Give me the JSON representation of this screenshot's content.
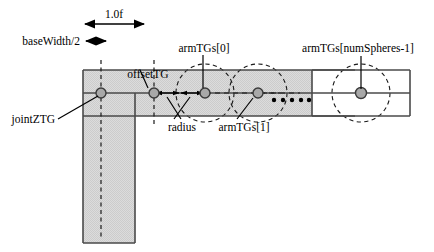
{
  "figure": {
    "kind": "technical-diagram",
    "background_color": "#ffffff",
    "line_color": "#000000",
    "fill_gray": "#d9d9d9",
    "sphere_fill": "#a8a8a8",
    "sphere_stroke": "#3a3a3a"
  },
  "labels": {
    "dim_length": "1.0f",
    "dim_base_width": "baseWidth/2",
    "arm_first": "armTGs[0]",
    "arm_second": "armTGs[1]",
    "arm_last": "armTGs[numSpheres-1]",
    "offset": "offsetTG",
    "joint": "jointZTG",
    "radius": "radius"
  },
  "geometry": {
    "bar": {
      "x": 83,
      "y": 70,
      "w": 327,
      "h": 46
    },
    "center_line_y": 93,
    "base_column": {
      "x": 83,
      "y": 93,
      "w": 52,
      "h": 150
    },
    "last_box": {
      "x": 312,
      "y": 70,
      "w": 98,
      "h": 46
    },
    "sphere_radius": 5,
    "circle_radius": 29,
    "spheres": [
      {
        "name": "jointZTG",
        "cx": 101,
        "cy": 93
      },
      {
        "name": "offsetTG",
        "cx": 154,
        "cy": 93
      },
      {
        "name": "armTGs[0]",
        "cx": 205,
        "cy": 93
      },
      {
        "name": "armTGs[1]",
        "cx": 258,
        "cy": 93
      },
      {
        "name": "armTGs[numSpheres-1]",
        "cx": 361,
        "cy": 93
      }
    ],
    "dashed_circles_cx": [
      205,
      258,
      361
    ],
    "ellipsis_dots_x": [
      274,
      283,
      292,
      301,
      310
    ],
    "ellipsis_dots_y": 100,
    "dim_length_arrow": {
      "x1": 83,
      "x2": 146,
      "y": 24
    },
    "dim_base_arrow": {
      "x1": 84,
      "x2": 108,
      "y": 41
    },
    "radius_arrows": [
      {
        "x1": 154,
        "x2": 180,
        "y": 93
      },
      {
        "x1": 180,
        "x2": 205,
        "y": 93
      }
    ]
  }
}
